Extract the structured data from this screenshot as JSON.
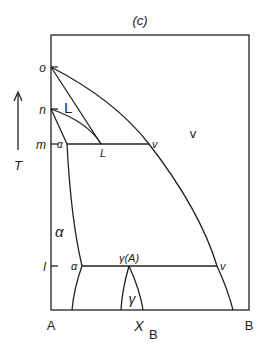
{
  "diagram": {
    "title": "(c)",
    "axis": {
      "temperature_label": "T",
      "composition_label_main": "X",
      "composition_label_sub": "B",
      "left_component": "A",
      "right_component": "B"
    },
    "temperature_marks": [
      "o",
      "n",
      "m",
      "l"
    ],
    "region_labels": {
      "liquid": "L",
      "vapor": "v",
      "alpha": "α",
      "gamma": "γ"
    },
    "point_labels": {
      "m_alpha": "α",
      "m_liquid": "L",
      "m_vapor": "v",
      "l_alpha": "α",
      "l_gamma": "γ(A)",
      "l_vapor": "v"
    },
    "colors": {
      "line": "#222222",
      "background": "#ffffff"
    }
  }
}
